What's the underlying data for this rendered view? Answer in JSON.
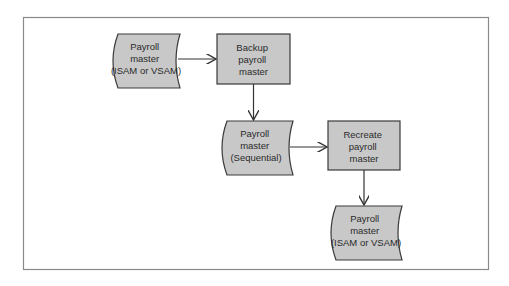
{
  "colors": {
    "frame": "#8a8a8a",
    "shape_fill": "#c8c8c8",
    "shape_stroke": "#3a3a3a",
    "arrow": "#333333",
    "text": "#2a2a2a"
  },
  "nodes": [
    {
      "id": "tape1",
      "type": "tape",
      "lines": [
        "Payroll",
        "master",
        "(ISAM or VSAM)"
      ]
    },
    {
      "id": "proc1",
      "type": "process",
      "lines": [
        "Backup",
        "payroll",
        "master"
      ]
    },
    {
      "id": "tape2",
      "type": "tape",
      "lines": [
        "Payroll",
        "master",
        "(Sequential)"
      ]
    },
    {
      "id": "proc2",
      "type": "process",
      "lines": [
        "Recreate",
        "payroll",
        "master"
      ]
    },
    {
      "id": "tape3",
      "type": "tape",
      "lines": [
        "Payroll",
        "master",
        "(ISAM or VSAM)"
      ]
    }
  ],
  "edges": [
    {
      "from": "tape1",
      "to": "proc1"
    },
    {
      "from": "proc1",
      "to": "tape2"
    },
    {
      "from": "tape2",
      "to": "proc2"
    },
    {
      "from": "proc2",
      "to": "tape3"
    }
  ]
}
